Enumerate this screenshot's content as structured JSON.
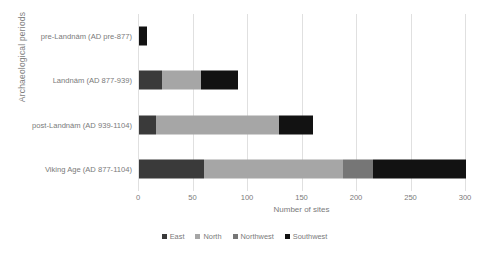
{
  "chart_data": {
    "type": "bar",
    "orientation": "horizontal",
    "stacked": true,
    "title": "",
    "xlabel": "Number of sites",
    "ylabel": "Archaeological periods",
    "xlim": [
      0,
      300
    ],
    "xticks": [
      0,
      50,
      100,
      150,
      200,
      250,
      300
    ],
    "grid": true,
    "legend_position": "bottom",
    "categories": [
      "pre-Landnám (AD pre-877)",
      "Landnám (AD 877-939)",
      "post-Landnám (AD 939-1104)",
      "Viking Age (AD 877-1104)"
    ],
    "series": [
      {
        "name": "East",
        "color": "#3a3a3a",
        "values": [
          0,
          21,
          16,
          60
        ]
      },
      {
        "name": "North",
        "color": "#a6a6a6",
        "values": [
          0,
          36,
          112,
          127
        ]
      },
      {
        "name": "Northwest",
        "color": "#767676",
        "values": [
          0,
          0,
          0,
          28
        ]
      },
      {
        "name": "Southwest",
        "color": "#121212",
        "values": [
          7,
          34,
          32,
          85
        ]
      }
    ],
    "totals": [
      7,
      91,
      160,
      300
    ]
  },
  "legend": {
    "items": [
      {
        "label": "East"
      },
      {
        "label": "North"
      },
      {
        "label": "Northwest"
      },
      {
        "label": "Southwest"
      }
    ]
  }
}
